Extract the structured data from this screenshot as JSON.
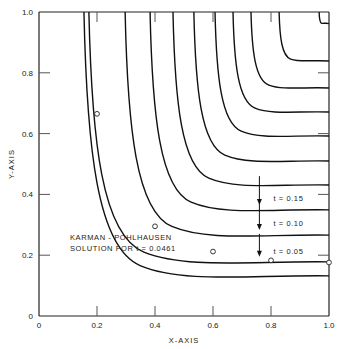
{
  "chart_data": {
    "type": "line",
    "title": "",
    "xlabel": "X-AXIS",
    "ylabel": "Y-AXIS",
    "xlim": [
      0,
      1.0
    ],
    "ylim": [
      0,
      1.0
    ],
    "grid": false,
    "x_ticks": [
      {
        "value": 0,
        "label": "0"
      },
      {
        "value": 0.2,
        "label": "0.2"
      },
      {
        "value": 0.4,
        "label": "0.4"
      },
      {
        "value": 0.6,
        "label": "0.6"
      },
      {
        "value": 0.8,
        "label": "0.8"
      },
      {
        "value": 1.0,
        "label": "1.0"
      }
    ],
    "y_ticks": [
      {
        "value": 0,
        "label": "0"
      },
      {
        "value": 0.2,
        "label": "0.2"
      },
      {
        "value": 0.4,
        "label": "0.4"
      },
      {
        "value": 0.6,
        "label": "0.6"
      },
      {
        "value": 0.8,
        "label": "0.8"
      },
      {
        "value": 1.0,
        "label": "1.0"
      }
    ],
    "series": [
      {
        "name": "Karman-Pohlhausen t=0.0461",
        "top_x": 0.155,
        "right_y": 0.132,
        "markers": [
          [
            0.2,
            0.665
          ],
          [
            0.4,
            0.295
          ],
          [
            0.6,
            0.212
          ],
          [
            0.8,
            0.183
          ],
          [
            1.0,
            0.176
          ]
        ]
      },
      {
        "name": "t=0.05",
        "top_x": 0.172,
        "right_y": 0.178
      },
      {
        "name": "t=0.10",
        "top_x": 0.297,
        "right_y": 0.266
      },
      {
        "name": "t=0.15",
        "top_x": 0.383,
        "right_y": 0.349
      },
      {
        "name": "t=0.20",
        "top_x": 0.462,
        "right_y": 0.431
      },
      {
        "name": "t=0.25",
        "top_x": 0.534,
        "right_y": 0.51
      },
      {
        "name": "t=0.30",
        "top_x": 0.607,
        "right_y": 0.592
      },
      {
        "name": "t=0.35",
        "top_x": 0.669,
        "right_y": 0.671
      },
      {
        "name": "t=0.40",
        "top_x": 0.731,
        "right_y": 0.75
      },
      {
        "name": "t=0.45",
        "top_x": 0.828,
        "right_y": 0.839
      },
      {
        "name": "t=corner",
        "top_x": 0.966,
        "right_y": 0.962
      }
    ],
    "annotations": [
      {
        "text": "t = 0.15",
        "x": 0.86,
        "y": 0.365,
        "arrow_x": 0.76,
        "arrow_from": 0.46,
        "arrow_to": 0.365
      },
      {
        "text": "t = 0.10",
        "x": 0.86,
        "y": 0.283,
        "arrow_x": 0.76,
        "arrow_from": 0.37,
        "arrow_to": 0.283
      },
      {
        "text": "t = 0.05",
        "x": 0.86,
        "y": 0.192,
        "arrow_x": 0.76,
        "arrow_from": 0.27,
        "arrow_to": 0.195
      }
    ],
    "legend_text": [
      "KARMAN - POHLHAUSEN",
      "SOLUTION  FOR  t = 0.0461"
    ]
  }
}
